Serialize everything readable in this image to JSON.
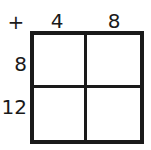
{
  "figure": {
    "kind": "addition-table",
    "operator": "+",
    "colors": {
      "ink": "#1a1a1a",
      "background": "#ffffff"
    }
  },
  "table": {
    "column_headers": [
      "4",
      "8"
    ],
    "row_headers": [
      "8",
      "12"
    ],
    "cells": [
      [
        "",
        ""
      ],
      [
        "",
        ""
      ]
    ]
  },
  "chart_data": {
    "type": "table",
    "title": "",
    "operator": "+",
    "columns": [
      "4",
      "8"
    ],
    "rows": [
      "8",
      "12"
    ],
    "values": [
      [
        "",
        ""
      ],
      [
        "",
        ""
      ]
    ]
  }
}
